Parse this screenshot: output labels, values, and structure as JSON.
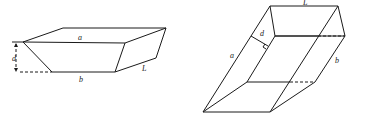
{
  "figures": [
    {
      "id": "trapezoidal-prism-flat",
      "labels": {
        "top_width": "a",
        "bottom_width": "b",
        "length": "L",
        "depth": "d"
      }
    },
    {
      "id": "trapezoidal-prism-inclined",
      "labels": {
        "length": "L",
        "depth": "d",
        "top_width": "a",
        "bottom_width": "b"
      }
    }
  ]
}
